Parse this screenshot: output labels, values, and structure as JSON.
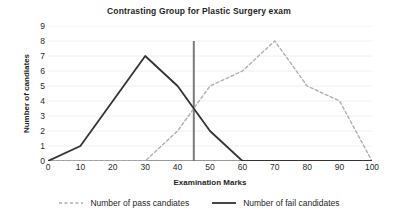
{
  "chart_data": {
    "type": "line",
    "title": "Contrasting Group for Plastic Surgery exam",
    "xlabel": "Examination Marks",
    "ylabel": "Number of candiates",
    "x": [
      0,
      10,
      20,
      30,
      40,
      50,
      60,
      70,
      80,
      90,
      100
    ],
    "xtick_labels": [
      "0",
      "10",
      "20",
      "30",
      "40",
      "50",
      "60",
      "70",
      "80",
      "90",
      "100"
    ],
    "ytick_labels": [
      "0",
      "1",
      "2",
      "3",
      "4",
      "5",
      "6",
      "7",
      "8",
      "9"
    ],
    "xlim": [
      0,
      100
    ],
    "ylim": [
      0,
      9
    ],
    "grid": true,
    "legend_position": "bottom",
    "series": [
      {
        "name": "Number of pass candiates",
        "style": "dashed",
        "color": "#b0b0b0",
        "values": [
          0,
          0,
          0,
          0,
          2,
          5,
          6,
          8,
          5,
          4,
          0
        ]
      },
      {
        "name": "Number of fail candidates",
        "style": "solid",
        "color": "#333333",
        "values": [
          0,
          1,
          4,
          7,
          5,
          2,
          0,
          0,
          0,
          0,
          0
        ]
      }
    ],
    "annotations": [
      {
        "name": "pass-mark-line",
        "type": "vertical-line",
        "x": 45,
        "y_from": 0,
        "y_to": 8,
        "color": "#7a7a7a"
      }
    ]
  }
}
